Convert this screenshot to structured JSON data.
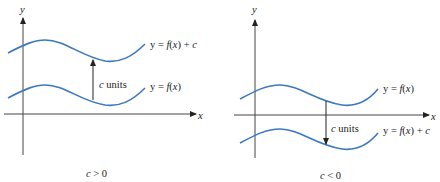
{
  "left_panel": {
    "y_axis_label": "y",
    "x_axis_label": "x",
    "upper_curve_label": "y = f(x) + c",
    "lower_curve_label": "y = f(x)",
    "shift_label": "c units",
    "caption": "c > 0",
    "shift_direction": "up"
  },
  "right_panel": {
    "y_axis_label": "y",
    "x_axis_label": "x",
    "upper_curve_label": "y = f(x)",
    "lower_curve_label": "y = f(x) + c",
    "shift_label": "c units",
    "caption": "c < 0",
    "shift_direction": "down"
  },
  "colors": {
    "curve": "#3a78c2",
    "axis": "#444444",
    "text": "#222222"
  }
}
